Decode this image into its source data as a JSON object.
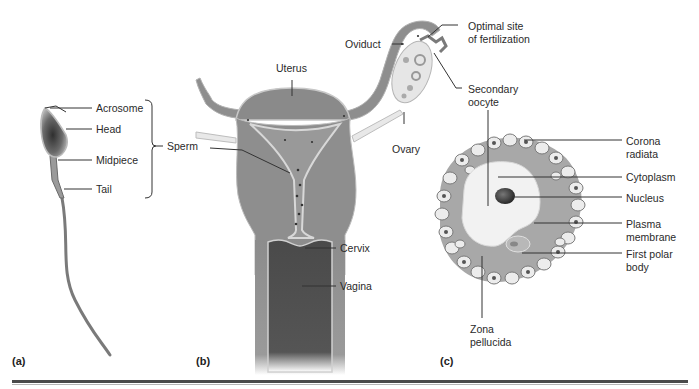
{
  "figure": {
    "panels": [
      {
        "id": "a",
        "label": "(a)"
      },
      {
        "id": "b",
        "label": "(b)"
      },
      {
        "id": "c",
        "label": "(c)"
      }
    ],
    "sperm_labels": {
      "acrosome": "Acrosome",
      "head": "Head",
      "midpiece": "Midpiece",
      "tail": "Tail",
      "group": "Sperm"
    },
    "tract_labels": {
      "uterus": "Uterus",
      "oviduct": "Oviduct",
      "optimal_site_1": "Optimal site",
      "optimal_site_2": "of fertilization",
      "secondary_oocyte_1": "Secondary",
      "secondary_oocyte_2": "oocyte",
      "ovary": "Ovary",
      "cervix": "Cervix",
      "vagina": "Vagina"
    },
    "oocyte_labels": {
      "corona_1": "Corona",
      "corona_2": "radiata",
      "cytoplasm": "Cytoplasm",
      "nucleus": "Nucleus",
      "plasma_1": "Plasma",
      "plasma_2": "membrane",
      "polar_1": "First polar",
      "polar_2": "body",
      "zona_1": "Zona",
      "zona_2": "pellucida"
    },
    "colors": {
      "tissue": "#8a8a8a",
      "tissue_dark": "#5e5e5e",
      "lining": "#cfcfcf",
      "zona": "#a9a9a9",
      "cytoplasm": "#f0f0f0"
    }
  }
}
